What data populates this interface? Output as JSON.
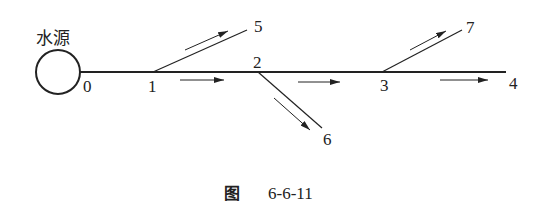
{
  "diagram": {
    "source_label": "水源",
    "nodes": [
      {
        "id": "0",
        "label": "0"
      },
      {
        "id": "1",
        "label": "1"
      },
      {
        "id": "2",
        "label": "2"
      },
      {
        "id": "3",
        "label": "3"
      },
      {
        "id": "4",
        "label": "4"
      },
      {
        "id": "5",
        "label": "5"
      },
      {
        "id": "6",
        "label": "6"
      },
      {
        "id": "7",
        "label": "7"
      }
    ],
    "edges": [
      {
        "from": "0",
        "to": "1"
      },
      {
        "from": "1",
        "to": "2"
      },
      {
        "from": "2",
        "to": "3"
      },
      {
        "from": "3",
        "to": "4"
      },
      {
        "from": "1",
        "to": "5"
      },
      {
        "from": "2",
        "to": "6"
      },
      {
        "from": "3",
        "to": "7"
      }
    ],
    "flow_direction": "from source 0 toward nodes 4, 5, 6, 7"
  },
  "caption": {
    "prefix": "图",
    "number": "6-6-11"
  }
}
